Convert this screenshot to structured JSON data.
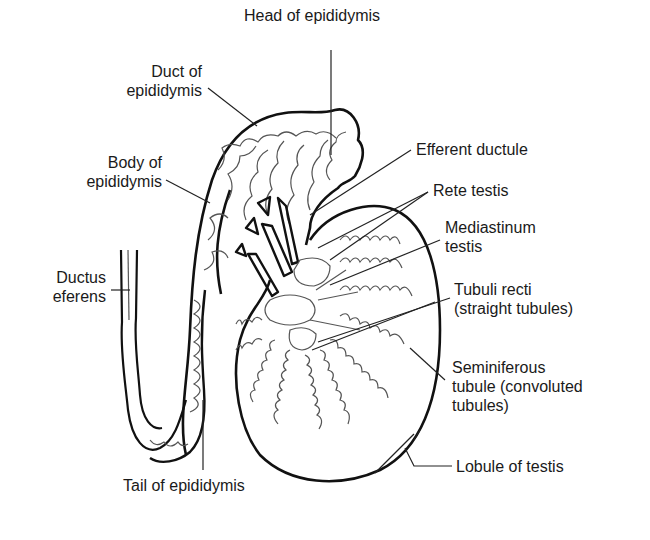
{
  "diagram": {
    "colors": {
      "background": "#ffffff",
      "outline": "#111111",
      "tubule": "#555555",
      "text": "#1a1a1a"
    },
    "labels": {
      "head_of_epididymis": [
        "Head of epididymis"
      ],
      "duct_of_epididymis": [
        "Duct of",
        "epididymis"
      ],
      "body_of_epididymis": [
        "Body of",
        "epididymis"
      ],
      "ductus_eferens": [
        "Ductus",
        "eferens"
      ],
      "efferent_ductule": [
        "Efferent ductule"
      ],
      "rete_testis": [
        "Rete testis"
      ],
      "mediastinum_testis": [
        "Mediastinum",
        "testis"
      ],
      "tubuli_recti": [
        "Tubuli recti",
        "(straight tubules)"
      ],
      "seminiferous_tubule": [
        "Seminiferous",
        "tubule (convoluted",
        "tubules)"
      ],
      "lobule_of_testis": [
        "Lobule of testis"
      ],
      "tail_of_epididymis": [
        "Tail of epididymis"
      ]
    }
  }
}
